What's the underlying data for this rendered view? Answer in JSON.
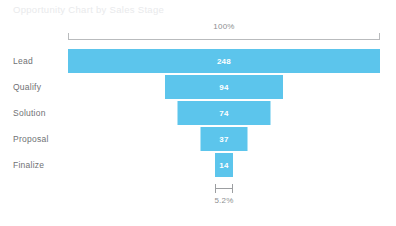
{
  "chart": {
    "title": "Opportunity Chart by Sales Stage",
    "top_scale_label": "100%",
    "bottom_scale_label": "5.2%",
    "bar_color": "#5cc5ec",
    "value_text_color": "#ffffff",
    "label_color": "#6f7174",
    "axis_color": "#b9bbbd",
    "background": "#ffffff"
  },
  "chart_data": {
    "type": "bar",
    "subtype": "funnel",
    "title": "Opportunity Chart by Sales Stage",
    "categories": [
      "Lead",
      "Qualify",
      "Solution",
      "Proposal",
      "Finalize"
    ],
    "values": [
      248,
      94,
      74,
      37,
      14
    ],
    "value_labels": [
      "248",
      "94",
      "74",
      "37",
      "14"
    ],
    "percent_of_top": [
      "100%",
      "37.9%",
      "29.8%",
      "14.9%",
      "5.2%"
    ],
    "top_axis_label": "100%",
    "bottom_axis_label": "5.2%",
    "xlabel": "",
    "ylabel": "",
    "orientation": "horizontal-centered",
    "grid": false,
    "legend": "none",
    "series": [
      {
        "name": "Opportunities",
        "values": [
          248,
          94,
          74,
          37,
          14
        ]
      }
    ]
  },
  "rows": [
    {
      "label": "Lead",
      "value": "248",
      "width_px": 312
    },
    {
      "label": "Qualify",
      "value": "94",
      "width_px": 118
    },
    {
      "label": "Solution",
      "value": "74",
      "width_px": 93
    },
    {
      "label": "Proposal",
      "value": "37",
      "width_px": 47
    },
    {
      "label": "Finalize",
      "value": "14",
      "width_px": 18
    }
  ]
}
